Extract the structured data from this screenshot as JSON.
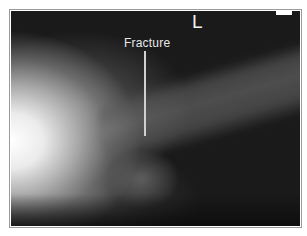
{
  "image": {
    "type": "radiograph",
    "description": "Lateral X-ray of elbow/forearm with annotated fracture"
  },
  "annotations": {
    "fracture_label": "Fracture",
    "side_marker": "L"
  },
  "colors": {
    "background": "#1a1a1a",
    "annotation_text": "#e8e8e8",
    "frame_border": "#9a9a9a"
  }
}
